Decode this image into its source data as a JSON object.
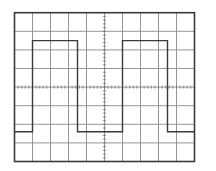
{
  "display": {
    "type": "oscilloscope-graticule",
    "frame": {
      "x": 14.5,
      "y": 12.7,
      "width": 180,
      "height": 148.8
    },
    "divisions": {
      "horizontal": 10,
      "vertical": 8
    },
    "minor_ticks_per_division": 5,
    "colors": {
      "background": "#ffffff",
      "grid": "#8a8a8a",
      "border": "#3a3a3a",
      "trace": "#3a3a3a",
      "ticks": "#6a6a6a"
    }
  },
  "chart_data": {
    "type": "line",
    "title": "",
    "xlabel": "",
    "ylabel": "",
    "x_unit": "divisions",
    "y_unit": "divisions from center",
    "xlim": [
      0,
      10
    ],
    "ylim": [
      -4,
      4
    ],
    "grid": true,
    "legend": null,
    "series": [
      {
        "name": "square-wave",
        "points": [
          [
            0,
            -2.4
          ],
          [
            1,
            -2.4
          ],
          [
            1,
            2.5
          ],
          [
            3.5,
            2.5
          ],
          [
            3.5,
            -2.4
          ],
          [
            6,
            -2.4
          ],
          [
            6,
            2.5
          ],
          [
            8.5,
            2.5
          ],
          [
            8.5,
            -2.4
          ],
          [
            10,
            -2.4
          ]
        ]
      }
    ],
    "period_divisions": 5,
    "duty_cycle": 0.5,
    "amplitude_pp_divisions": 4.9
  }
}
